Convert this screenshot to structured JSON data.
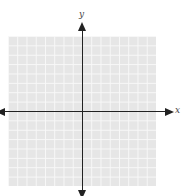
{
  "chart_data": {
    "type": "scatter",
    "title": "",
    "xlabel": "x",
    "ylabel": "y",
    "xlim": [
      -8,
      8
    ],
    "ylim": [
      -8,
      8
    ],
    "grid": true,
    "grid_cells": {
      "x": 16,
      "y": 16
    },
    "series": [],
    "axes_arrows": true
  },
  "labels": {
    "x": "x",
    "y": "y"
  },
  "colors": {
    "grid_fill": "#e6e6e6",
    "grid_line": "#f8f8f8",
    "axis": "#222222"
  }
}
